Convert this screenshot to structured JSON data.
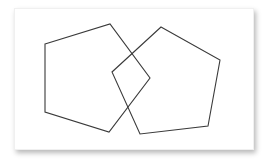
{
  "diagram": {
    "title": "",
    "stroke_color": "#3a3a3a",
    "stroke_width": 1.1,
    "card_background": "#ffffff",
    "shapes": [
      {
        "id": "left-pentagon",
        "type": "pentagon",
        "points": "45,44 110,24 150,78 109,132 45,112"
      },
      {
        "id": "right-pentagon",
        "type": "pentagon",
        "points": "161,27 220,60 208,126 140,134 112,72"
      }
    ]
  }
}
